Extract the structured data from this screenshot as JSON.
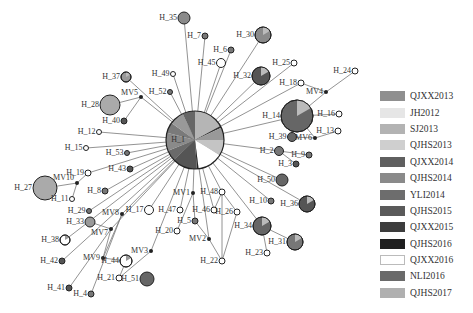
{
  "diagram": {
    "type": "haplotype-network",
    "hub": {
      "id": "H_1",
      "x": 195,
      "y": 140,
      "r": 29
    },
    "nodes": [
      {
        "id": "H_35",
        "x": 184,
        "y": 18,
        "r": 6,
        "fill": "#8a8a8a",
        "lx": -16,
        "ly": 0
      },
      {
        "id": "H_7",
        "x": 205,
        "y": 36,
        "r": 3,
        "fill": "#777",
        "lx": -15,
        "ly": 0
      },
      {
        "id": "H_6",
        "x": 231,
        "y": 50,
        "r": 3,
        "fill": "#777",
        "lx": -13,
        "ly": 0
      },
      {
        "id": "H_45",
        "x": 221,
        "y": 63,
        "r": 4.5,
        "fill": "#fff",
        "lx": -17,
        "ly": 0
      },
      {
        "id": "H_30",
        "x": 263,
        "y": 35,
        "r": 8,
        "fill": "#8a8a8a",
        "lx": -24,
        "ly": 0,
        "pie": true
      },
      {
        "id": "H_32",
        "x": 261,
        "y": 76,
        "r": 9,
        "fill": "#555",
        "lx": -26,
        "ly": 0,
        "pie": true
      },
      {
        "id": "H_25",
        "x": 294,
        "y": 63,
        "r": 3,
        "fill": "#fff",
        "lx": -20,
        "ly": 0
      },
      {
        "id": "H_18",
        "x": 301,
        "y": 83,
        "r": 3,
        "fill": "#fff",
        "lx": -21,
        "ly": 0
      },
      {
        "id": "H_24",
        "x": 355,
        "y": 71,
        "r": 3,
        "fill": "#fff",
        "lx": -20,
        "ly": 0
      },
      {
        "id": "H_14",
        "x": 297,
        "y": 116,
        "r": 16,
        "fill": "#666",
        "lx": -36,
        "ly": 0,
        "pie": true
      },
      {
        "id": "H_16",
        "x": 339,
        "y": 114,
        "r": 3,
        "fill": "#fff",
        "lx": -20,
        "ly": 0
      },
      {
        "id": "H_13",
        "x": 338,
        "y": 131,
        "r": 3,
        "fill": "#fff",
        "lx": -20,
        "ly": 0
      },
      {
        "id": "H_39",
        "x": 292,
        "y": 137,
        "r": 4.5,
        "fill": "#666",
        "lx": -21,
        "ly": 0
      },
      {
        "id": "H_2",
        "x": 279,
        "y": 151,
        "r": 4.5,
        "fill": "#777",
        "lx": -20,
        "ly": 0
      },
      {
        "id": "H_9",
        "x": 309,
        "y": 155,
        "r": 3,
        "fill": "#777",
        "lx": -14,
        "ly": 0
      },
      {
        "id": "H_3",
        "x": 296,
        "y": 164,
        "r": 3,
        "fill": "#555",
        "lx": -14,
        "ly": 0
      },
      {
        "id": "H_50",
        "x": 282,
        "y": 180,
        "r": 6,
        "fill": "#666",
        "lx": -19,
        "ly": 0
      },
      {
        "id": "H_10",
        "x": 271,
        "y": 201,
        "r": 3,
        "fill": "#777",
        "lx": -19,
        "ly": 0
      },
      {
        "id": "H_36",
        "x": 307,
        "y": 204,
        "r": 8,
        "fill": "#555",
        "lx": -26,
        "ly": 0,
        "pie": true
      },
      {
        "id": "H_34",
        "x": 262,
        "y": 226,
        "r": 9,
        "fill": "#666",
        "lx": -26,
        "ly": 0,
        "pie": true
      },
      {
        "id": "H_31",
        "x": 295,
        "y": 242,
        "r": 8,
        "fill": "#777",
        "lx": -26,
        "ly": 0,
        "pie": true
      },
      {
        "id": "H_23",
        "x": 267,
        "y": 253,
        "r": 3,
        "fill": "#fff",
        "lx": -20,
        "ly": 0
      },
      {
        "id": "H_48",
        "x": 222,
        "y": 192,
        "r": 3,
        "fill": "#fff",
        "lx": -20,
        "ly": 0
      },
      {
        "id": "H_46",
        "x": 214,
        "y": 210,
        "r": 3,
        "fill": "#fff",
        "lx": -20,
        "ly": 0
      },
      {
        "id": "H_26",
        "x": 237,
        "y": 212,
        "r": 3,
        "fill": "#fff",
        "lx": -19,
        "ly": 0
      },
      {
        "id": "H_5",
        "x": 195,
        "y": 221,
        "r": 3,
        "fill": "#777",
        "lx": -14,
        "ly": 0
      },
      {
        "id": "H_22",
        "x": 222,
        "y": 261,
        "r": 3,
        "fill": "#fff",
        "lx": -20,
        "ly": 0
      },
      {
        "id": "H_47",
        "x": 180,
        "y": 210,
        "r": 3,
        "fill": "#fff",
        "lx": -18,
        "ly": 0
      },
      {
        "id": "H_20",
        "x": 177,
        "y": 231,
        "r": 3,
        "fill": "#fff",
        "lx": -18,
        "ly": 0
      },
      {
        "id": "H_17",
        "x": 149,
        "y": 210,
        "r": 4.5,
        "fill": "#fff",
        "lx": -20,
        "ly": 0
      },
      {
        "id": "H_44",
        "x": 126,
        "y": 261,
        "r": 6,
        "fill": "#fff",
        "lx": -20,
        "ly": 0,
        "pie": true
      },
      {
        "id": "H_21",
        "x": 119,
        "y": 278,
        "r": 3,
        "fill": "#fff",
        "lx": -20,
        "ly": 0
      },
      {
        "id": "H_51",
        "x": 147,
        "y": 279,
        "r": 7,
        "fill": "#666",
        "lx": -23,
        "ly": 0
      },
      {
        "id": "H_4",
        "x": 91,
        "y": 294,
        "r": 3,
        "fill": "#777",
        "lx": -15,
        "ly": 0
      },
      {
        "id": "H_41",
        "x": 69,
        "y": 288,
        "r": 3,
        "fill": "#555",
        "lx": -20,
        "ly": 0
      },
      {
        "id": "H_42",
        "x": 62,
        "y": 261,
        "r": 3,
        "fill": "#555",
        "lx": -20,
        "ly": 0
      },
      {
        "id": "H_38",
        "x": 65,
        "y": 240,
        "r": 5,
        "fill": "#fff",
        "lx": -22,
        "ly": 0,
        "pie": true
      },
      {
        "id": "H_33",
        "x": 90,
        "y": 222,
        "r": 5,
        "fill": "#999",
        "lx": -21,
        "ly": 0
      },
      {
        "id": "H_29",
        "x": 89,
        "y": 211,
        "r": 2.5,
        "fill": "#777",
        "lx": -19,
        "ly": 0
      },
      {
        "id": "H_8",
        "x": 105,
        "y": 191,
        "r": 3,
        "fill": "#777",
        "lx": -14,
        "ly": 0
      },
      {
        "id": "H_43",
        "x": 130,
        "y": 169,
        "r": 3,
        "fill": "#555",
        "lx": -19,
        "ly": 0
      },
      {
        "id": "H_19",
        "x": 88,
        "y": 173,
        "r": 3,
        "fill": "#fff",
        "lx": -19,
        "ly": 0
      },
      {
        "id": "H_11",
        "x": 72,
        "y": 199,
        "r": 2.5,
        "fill": "#fff",
        "lx": -19,
        "ly": 0
      },
      {
        "id": "H_27",
        "x": 45,
        "y": 188,
        "r": 12,
        "fill": "#aaa",
        "lx": -28,
        "ly": 0
      },
      {
        "id": "H_53",
        "x": 127,
        "y": 153,
        "r": 2.5,
        "fill": "#777",
        "lx": -19,
        "ly": 0
      },
      {
        "id": "H_15",
        "x": 86,
        "y": 148,
        "r": 2.5,
        "fill": "#fff",
        "lx": -19,
        "ly": 0
      },
      {
        "id": "H_12",
        "x": 99,
        "y": 132,
        "r": 2.5,
        "fill": "#fff",
        "lx": -19,
        "ly": 0
      },
      {
        "id": "H_40",
        "x": 124,
        "y": 121,
        "r": 3,
        "fill": "#555",
        "lx": -18,
        "ly": 0
      },
      {
        "id": "H_28",
        "x": 110,
        "y": 105,
        "r": 10,
        "fill": "#aaa",
        "lx": -27,
        "ly": 0
      },
      {
        "id": "H_37",
        "x": 126,
        "y": 77,
        "r": 5,
        "fill": "#999",
        "lx": -22,
        "ly": 0,
        "pie": true
      },
      {
        "id": "H_52",
        "x": 170,
        "y": 92,
        "r": 2.5,
        "fill": "#777",
        "lx": -19,
        "ly": 0
      },
      {
        "id": "H_49",
        "x": 173,
        "y": 74,
        "r": 2.5,
        "fill": "#fff",
        "lx": -19,
        "ly": 0
      }
    ],
    "median_vectors": [
      {
        "id": "MV1",
        "x": 193,
        "y": 193,
        "lx": -14,
        "ly": 0
      },
      {
        "id": "MV2",
        "x": 209,
        "y": 239,
        "lx": -20,
        "ly": 0
      },
      {
        "id": "MV3",
        "x": 151,
        "y": 251,
        "lx": -19,
        "ly": 0
      },
      {
        "id": "MV4",
        "x": 326,
        "y": 92,
        "lx": -20,
        "ly": 0
      },
      {
        "id": "MV5",
        "x": 141,
        "y": 97,
        "lx": -16,
        "ly": -4
      },
      {
        "id": "MV6",
        "x": 315,
        "y": 138,
        "lx": -19,
        "ly": 0
      },
      {
        "id": "MV7",
        "x": 111,
        "y": 229,
        "lx": -18,
        "ly": 4
      },
      {
        "id": "MV8",
        "x": 122,
        "y": 214,
        "lx": -18,
        "ly": -1
      },
      {
        "id": "MV9",
        "x": 103,
        "y": 258,
        "lx": -19,
        "ly": 0
      },
      {
        "id": "MV10",
        "x": 77,
        "y": 183,
        "lx": -20,
        "ly": -5
      }
    ],
    "edges": [
      [
        "H_1",
        "H_35"
      ],
      [
        "H_1",
        "H_7"
      ],
      [
        "H_1",
        "H_6"
      ],
      [
        "H_1",
        "H_45"
      ],
      [
        "H_1",
        "H_30"
      ],
      [
        "H_1",
        "H_32"
      ],
      [
        "H_1",
        "H_25"
      ],
      [
        "H_1",
        "H_18"
      ],
      [
        "H_1",
        "H_14"
      ],
      [
        "H_1",
        "H_2"
      ],
      [
        "H_1",
        "H_50"
      ],
      [
        "H_1",
        "H_10"
      ],
      [
        "H_1",
        "H_36"
      ],
      [
        "H_1",
        "H_34"
      ],
      [
        "H_1",
        "H_48"
      ],
      [
        "H_1",
        "H_46"
      ],
      [
        "H_1",
        "MV1"
      ],
      [
        "H_1",
        "MV2"
      ],
      [
        "H_1",
        "H_47"
      ],
      [
        "H_1",
        "H_17"
      ],
      [
        "H_1",
        "MV3"
      ],
      [
        "H_1",
        "MV8"
      ],
      [
        "H_1",
        "MV7"
      ],
      [
        "H_1",
        "H_42"
      ],
      [
        "H_1",
        "H_38"
      ],
      [
        "H_1",
        "H_29"
      ],
      [
        "H_1",
        "H_8"
      ],
      [
        "H_1",
        "H_43"
      ],
      [
        "H_1",
        "H_19"
      ],
      [
        "H_1",
        "H_53"
      ],
      [
        "H_1",
        "H_15"
      ],
      [
        "H_1",
        "H_12"
      ],
      [
        "H_1",
        "MV5"
      ],
      [
        "H_1",
        "H_37"
      ],
      [
        "H_1",
        "H_52"
      ],
      [
        "H_1",
        "H_49"
      ],
      [
        "H_14",
        "MV4"
      ],
      [
        "MV4",
        "H_24"
      ],
      [
        "MV4",
        "H_18"
      ],
      [
        "H_14",
        "H_16"
      ],
      [
        "H_14",
        "MV6"
      ],
      [
        "MV6",
        "H_13"
      ],
      [
        "MV6",
        "H_39"
      ],
      [
        "H_2",
        "H_9"
      ],
      [
        "H_2",
        "H_3"
      ],
      [
        "H_34",
        "H_31"
      ],
      [
        "H_34",
        "H_23"
      ],
      [
        "H_48",
        "H_26"
      ],
      [
        "H_48",
        "H_22"
      ],
      [
        "H_26",
        "H_22"
      ],
      [
        "H_48",
        "H_46"
      ],
      [
        "MV1",
        "H_5"
      ],
      [
        "MV1",
        "H_20"
      ],
      [
        "H_5",
        "MV2"
      ],
      [
        "MV2",
        "H_22"
      ],
      [
        "MV3",
        "H_21"
      ],
      [
        "H_44",
        "H_21"
      ],
      [
        "MV8",
        "H_4"
      ],
      [
        "MV8",
        "MV9"
      ],
      [
        "MV7",
        "MV9"
      ],
      [
        "MV7",
        "H_41"
      ],
      [
        "MV9",
        "H_44"
      ],
      [
        "MV7",
        "H_33"
      ],
      [
        "H_19",
        "MV10"
      ],
      [
        "MV10",
        "H_27"
      ],
      [
        "MV10",
        "H_11"
      ],
      [
        "MV5",
        "H_28"
      ],
      [
        "MV5",
        "H_40"
      ]
    ],
    "hub_slices": [
      {
        "color": "#b5b5b5",
        "frac": 0.17
      },
      {
        "color": "#333",
        "frac": 0.01
      },
      {
        "color": "#999",
        "frac": 0.07
      },
      {
        "color": "#c4c4c4",
        "frac": 0.09
      },
      {
        "color": "#fff",
        "frac": 0.14
      },
      {
        "color": "#222",
        "frac": 0.01
      },
      {
        "color": "#555",
        "frac": 0.14
      },
      {
        "color": "#6a6a6a",
        "frac": 0.06
      },
      {
        "color": "#8a8a8a",
        "frac": 0.1
      },
      {
        "color": "#7a7a7a",
        "frac": 0.06
      },
      {
        "color": "#999",
        "frac": 0.08
      },
      {
        "color": "#666",
        "frac": 0.07
      }
    ]
  },
  "legend": {
    "items": [
      {
        "label": "QJXX2013",
        "color": "#8f8f8f"
      },
      {
        "label": "JH2012",
        "color": "#e6e6e6"
      },
      {
        "label": "SJ2013",
        "color": "#b3b3b3"
      },
      {
        "label": "QJHS2013",
        "color": "#cfcfcf"
      },
      {
        "label": "QJXX2014",
        "color": "#5f5f5f"
      },
      {
        "label": "QJHS2014",
        "color": "#8a8a8a"
      },
      {
        "label": "YLI2014",
        "color": "#6d6d6d"
      },
      {
        "label": "QJHS2015",
        "color": "#5a5a5a"
      },
      {
        "label": "QJXX2015",
        "color": "#3d3d3d"
      },
      {
        "label": "QJHS2016",
        "color": "#1f1f1f"
      },
      {
        "label": "QJXX2016",
        "color": "#ffffff"
      },
      {
        "label": "NLI2016",
        "color": "#6a6a6a"
      },
      {
        "label": "QJHS2017",
        "color": "#b0b0b0"
      }
    ]
  }
}
